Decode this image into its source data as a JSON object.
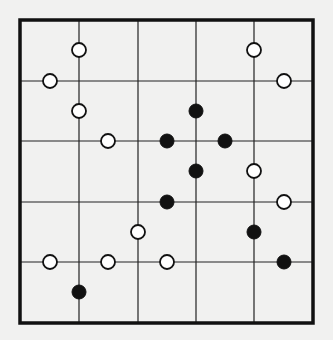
{
  "puzzle": {
    "type": "masyu-style pearl grid",
    "colors": {
      "background": "#f1f1f0",
      "line": "#222222",
      "border": "#111111",
      "white_pearl_fill": "#ffffff",
      "black_pearl_fill": "#111111"
    },
    "frame": {
      "left": 20,
      "top": 20,
      "right": 313,
      "bottom": 323
    },
    "vertical_lines_x": [
      79,
      138,
      196,
      254
    ],
    "horizontal_lines_y": [
      81,
      141,
      202,
      262
    ],
    "half_grid": {
      "x": [
        20,
        50,
        79,
        108,
        138,
        167,
        196,
        225,
        254,
        284,
        313
      ],
      "y": [
        20,
        50,
        81,
        111,
        141,
        171,
        202,
        232,
        262,
        292,
        323
      ]
    },
    "pearl_radius": 7,
    "pearls": [
      {
        "color": "white",
        "col": 2,
        "row": 1
      },
      {
        "color": "white",
        "col": 8,
        "row": 1
      },
      {
        "color": "white",
        "col": 1,
        "row": 2
      },
      {
        "color": "white",
        "col": 9,
        "row": 2
      },
      {
        "color": "white",
        "col": 2,
        "row": 3
      },
      {
        "color": "black",
        "col": 6,
        "row": 3
      },
      {
        "color": "white",
        "col": 3,
        "row": 4
      },
      {
        "color": "black",
        "col": 5,
        "row": 4
      },
      {
        "color": "black",
        "col": 7,
        "row": 4
      },
      {
        "color": "black",
        "col": 6,
        "row": 5
      },
      {
        "color": "white",
        "col": 8,
        "row": 5
      },
      {
        "color": "black",
        "col": 5,
        "row": 6
      },
      {
        "color": "white",
        "col": 9,
        "row": 6
      },
      {
        "color": "white",
        "col": 4,
        "row": 7
      },
      {
        "color": "black",
        "col": 8,
        "row": 7
      },
      {
        "color": "white",
        "col": 1,
        "row": 8
      },
      {
        "color": "white",
        "col": 3,
        "row": 8
      },
      {
        "color": "white",
        "col": 5,
        "row": 8
      },
      {
        "color": "black",
        "col": 9,
        "row": 8
      },
      {
        "color": "black",
        "col": 2,
        "row": 9
      }
    ]
  }
}
